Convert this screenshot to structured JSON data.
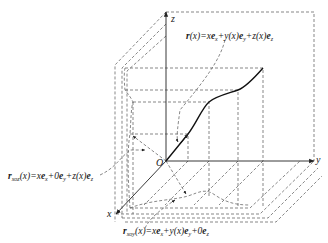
{
  "diagram": {
    "type": "3d-coordinate-system",
    "axes": {
      "x": "x",
      "y": "y",
      "z": "z",
      "origin": "O"
    },
    "labels": {
      "r_main": {
        "prefix": "r",
        "arg": "(x)=x",
        "e1": "e",
        "s1": "x",
        "p1": "+y(x)",
        "e2": "e",
        "s2": "y",
        "p2": "+z(x)",
        "e3": "e",
        "s3": "z"
      },
      "r_xoz": {
        "prefix": "r",
        "sub": "xoz",
        "arg": "(x)=x",
        "e1": "e",
        "s1": "x",
        "p1": "+0",
        "e2": "e",
        "s2": "y",
        "p2": "+z(x)",
        "e3": "e",
        "s3": "z"
      },
      "r_xoy": {
        "prefix": "r",
        "sub": "xoy",
        "arg": "(x)=x",
        "e1": "e",
        "s1": "x",
        "p1": "+y(x)",
        "e2": "e",
        "s2": "y",
        "p2": "+0",
        "e3": "e",
        "s3": "z"
      }
    },
    "equations_text": [
      "r(x)=xe_x+y(x)e_y+z(x)e_z",
      "r_xoz(x)=xe_x+0e_y+z(x)e_z",
      "r_xoy(x)=xe_x+y(x)e_y+0e_z"
    ],
    "colors": {
      "line": "#333333",
      "curve": "#111111",
      "dashed": "#555555"
    }
  }
}
